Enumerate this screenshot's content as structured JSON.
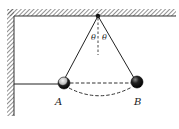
{
  "diagram": {
    "title": "",
    "type": "physics-pendulum",
    "labels": {
      "angle_left": "θ",
      "angle_right": "θ",
      "ball_a": "A",
      "ball_b": "B"
    },
    "colors": {
      "line": "#222222",
      "hatch": "#555555",
      "ball_a_light": "#f2f2f2",
      "ball_a_dark": "#111111",
      "ball_b_light": "#777777",
      "ball_b_dark": "#000000",
      "background": "#ffffff"
    },
    "elements": [
      "ceiling-hatched",
      "left-wall-hatched",
      "pivot-point",
      "string-to-A",
      "string-to-B",
      "vertical-dashed-reference",
      "horizontal-string-wall-to-A",
      "dashed-chord-A-B",
      "dashed-arc-A-B",
      "ball-A",
      "ball-B"
    ]
  }
}
